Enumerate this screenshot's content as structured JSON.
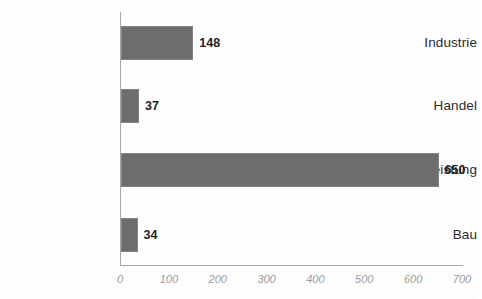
{
  "chart_data": {
    "type": "bar",
    "orientation": "horizontal",
    "title": "",
    "subtitle": "",
    "xlabel": "",
    "ylabel": "",
    "categories": [
      "Industrie",
      "Handel",
      "Dienstleistung",
      "Bau"
    ],
    "values": [
      148,
      37,
      650,
      34
    ],
    "data_labels": [
      "148",
      "37",
      "650",
      "34"
    ],
    "xlim": [
      0,
      700
    ],
    "xticks": [
      0,
      100,
      200,
      300,
      400,
      500,
      600,
      700
    ],
    "xtick_labels": [
      "0",
      "100",
      "200",
      "300",
      "400",
      "500",
      "600",
      "700"
    ],
    "grid": false,
    "legend": false,
    "legend_position": "none",
    "series": [
      {
        "name": "",
        "values": [
          148,
          37,
          650,
          34
        ]
      }
    ],
    "colors": {
      "bar_fill": "#6d6d6d",
      "bar_border": "#828282",
      "axis_line": "#a6a6a6",
      "tick_label": "#9b9b9b",
      "category_label": "#2b2b2b",
      "value_label": "#1f1f1f",
      "background": "#ffffff"
    }
  }
}
